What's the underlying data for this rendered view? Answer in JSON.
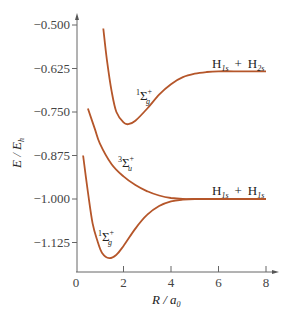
{
  "chart_data": {
    "type": "line",
    "title": "",
    "xlabel": "R / a0",
    "ylabel": "E / Eh",
    "xlim": [
      0,
      8.5
    ],
    "ylim": [
      -1.2,
      -0.47
    ],
    "grid": false,
    "legend": "none",
    "x_ticks": [
      "0",
      "2",
      "4",
      "6",
      "8"
    ],
    "y_ticks": [
      "-0.500",
      "-0.625",
      "-0.750",
      "-0.875",
      "-1.000",
      "-1.125"
    ],
    "line_color": "#b5562a",
    "series": [
      {
        "name": "1Σg+ (excited, → H1s + H2s)",
        "x": [
          1.15,
          1.3,
          1.5,
          1.7,
          2.0,
          2.2,
          2.5,
          3.0,
          3.5,
          4.0,
          4.5,
          5.0,
          5.5,
          6.0,
          7.0,
          8.0
        ],
        "y": [
          -0.51,
          -0.6,
          -0.69,
          -0.75,
          -0.78,
          -0.785,
          -0.775,
          -0.74,
          -0.7,
          -0.67,
          -0.65,
          -0.64,
          -0.635,
          -0.633,
          -0.633,
          -0.633
        ]
      },
      {
        "name": "3Σu+ (→ H1s + H1s)",
        "x": [
          0.5,
          0.8,
          1.0,
          1.5,
          2.0,
          2.5,
          3.0,
          3.5,
          4.0,
          4.5,
          5.0,
          6.0,
          7.0,
          8.0
        ],
        "y": [
          -0.74,
          -0.8,
          -0.84,
          -0.9,
          -0.935,
          -0.96,
          -0.978,
          -0.99,
          -0.997,
          -1.0,
          -1.0,
          -1.0,
          -1.0,
          -1.0
        ]
      },
      {
        "name": "1Σg+ (ground, → H1s + H1s)",
        "x": [
          0.3,
          0.5,
          0.7,
          0.9,
          1.1,
          1.4,
          1.7,
          2.0,
          2.5,
          3.0,
          3.5,
          4.0,
          4.5,
          5.0,
          6.0
        ],
        "y": [
          -0.875,
          -0.98,
          -1.07,
          -1.12,
          -1.155,
          -1.17,
          -1.16,
          -1.135,
          -1.085,
          -1.045,
          -1.02,
          -1.007,
          -1.002,
          -1.0,
          -1.0
        ]
      }
    ],
    "annotations": [
      {
        "text": "H1s + H2s",
        "x": 7.0,
        "y": -0.6
      },
      {
        "text": "1Σg+",
        "x": 2.6,
        "y": -0.72
      },
      {
        "text": "3Σu+",
        "x": 2.8,
        "y": -0.91
      },
      {
        "text": "H1s + H1s",
        "x": 7.0,
        "y": -0.97
      },
      {
        "text": "1Σg+",
        "x": 1.2,
        "y": -1.09
      }
    ]
  },
  "labels": {
    "x_axis": {
      "main": "R",
      "slash": " / ",
      "var": "a",
      "sub": "0"
    },
    "y_axis": {
      "main": "E",
      "slash": " / ",
      "var": "E",
      "sub": "h"
    },
    "asym_upper": {
      "h1": "H",
      "s1": "1s",
      "plus": "+",
      "h2": "H",
      "s2": "2s"
    },
    "asym_lower": {
      "h1": "H",
      "s1": "1s",
      "plus": "+",
      "h2": "H",
      "s2": "1s"
    },
    "state_upper": {
      "pre": "1",
      "sigma": "Σ",
      "sup": "+",
      "sub": "g"
    },
    "state_triplet": {
      "pre": "3",
      "sigma": "Σ",
      "sup": "+",
      "sub": "u"
    },
    "state_ground": {
      "pre": "1",
      "sigma": "Σ",
      "sup": "+",
      "sub": "g"
    }
  }
}
